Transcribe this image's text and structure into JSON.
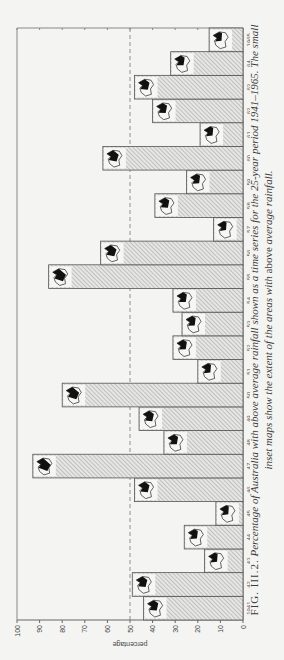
{
  "chart_data": {
    "type": "bar",
    "title": "",
    "xlabel": "",
    "ylabel": "percentage",
    "ylim": [
      0,
      100
    ],
    "yticks": [
      0,
      10,
      20,
      30,
      40,
      50,
      60,
      70,
      80,
      90,
      100
    ],
    "reference_line": {
      "value": 50,
      "style": "dashed"
    },
    "categories": [
      "1941",
      "42",
      "43",
      "44",
      "45",
      "46",
      "47",
      "48",
      "49",
      "50",
      "51",
      "52",
      "53",
      "54",
      "55",
      "56",
      "57",
      "58",
      "59",
      "60",
      "61",
      "62",
      "63",
      "64",
      "1965"
    ],
    "values": [
      44,
      49,
      17,
      26,
      12,
      48,
      93,
      35,
      46,
      80,
      20,
      31,
      27,
      31,
      86,
      63,
      13,
      39,
      25,
      62,
      19,
      40,
      48,
      32,
      15
    ],
    "bar_fill": "diagonal hatching",
    "insets": "small map of Australia inside each bar showing extent of above-average rainfall",
    "grid": false,
    "legend": null
  },
  "caption": {
    "fig_label": "FIG. III.2.",
    "line1": "Percentage of Australia with above average rainfall shown as a time series for the 25-year period 1941–1965. The small",
    "line2_a": "inset maps show the extent of the areas with",
    "line2_b": "above",
    "line2_c": "average rainfall."
  },
  "colors": {
    "background": "#f4f4f2",
    "axis": "#666666",
    "bar_stroke": "#555555",
    "hatch": "#9a9a9a",
    "map": "#111111"
  }
}
